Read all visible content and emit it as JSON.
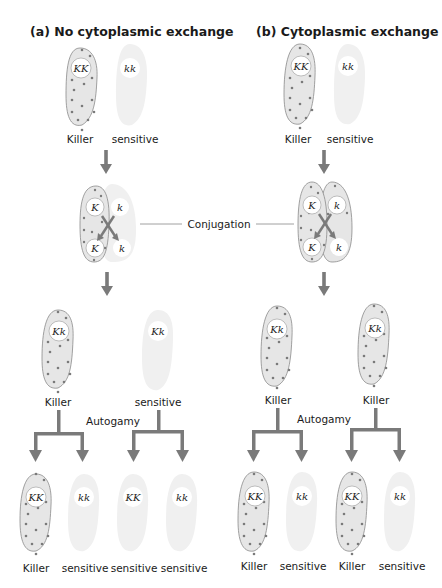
{
  "panels": {
    "a": {
      "title": "(a) No cytoplasmic exchange",
      "parents": [
        {
          "genotype": "KK",
          "phenotype": "Killer"
        },
        {
          "genotype": "kk",
          "phenotype": "sensitive"
        }
      ],
      "conjugants": {
        "left_top": "K",
        "left_bottom": "K",
        "right_top": "k",
        "right_bottom": "k"
      },
      "exconjugants": [
        {
          "genotype": "Kk",
          "phenotype": "Killer"
        },
        {
          "genotype": "Kk",
          "phenotype": "sensitive"
        }
      ],
      "progeny": [
        {
          "genotype": "KK",
          "phenotype": "Killer"
        },
        {
          "genotype": "kk",
          "phenotype": "sensitive"
        },
        {
          "genotype": "KK",
          "phenotype": "sensitive"
        },
        {
          "genotype": "kk",
          "phenotype": "sensitive"
        }
      ],
      "autogamy_label": "Autogamy"
    },
    "b": {
      "title": "(b) Cytoplasmic exchange",
      "parents": [
        {
          "genotype": "KK",
          "phenotype": "Killer"
        },
        {
          "genotype": "kk",
          "phenotype": "sensitive"
        }
      ],
      "conjugants": {
        "left_top": "K",
        "left_bottom": "K",
        "right_top": "k",
        "right_bottom": "k"
      },
      "exconjugants": [
        {
          "genotype": "Kk",
          "phenotype": "Killer"
        },
        {
          "genotype": "Kk",
          "phenotype": "Killer"
        }
      ],
      "progeny": [
        {
          "genotype": "KK",
          "phenotype": "Killer"
        },
        {
          "genotype": "kk",
          "phenotype": "sensitive"
        },
        {
          "genotype": "KK",
          "phenotype": "Killer"
        },
        {
          "genotype": "kk",
          "phenotype": "sensitive"
        }
      ],
      "autogamy_label": "Autogamy"
    }
  },
  "conjugation_label": "Conjugation",
  "colors": {
    "killer_fill": "#e6e6e6",
    "sensitive_fill": "#f0f0f0",
    "arrow": "#7a7a7a",
    "dot": "#7a7a7a"
  }
}
